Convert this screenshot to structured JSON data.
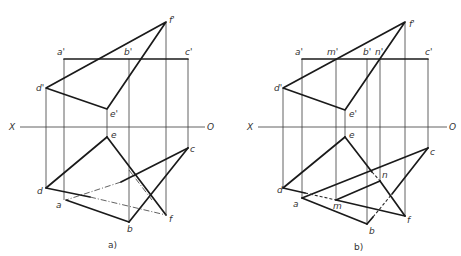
{
  "figure_a": {
    "caption": "a)",
    "axis": {
      "left_label": "X",
      "right_label": "O"
    },
    "labels": {
      "a_prime": "a'",
      "b_prime": "b'",
      "c_prime": "c'",
      "d_prime": "d'",
      "e_prime": "e'",
      "f_prime": "f'",
      "a": "a",
      "b": "b",
      "c": "c",
      "d": "d",
      "e": "e",
      "f": "f"
    }
  },
  "figure_b": {
    "caption": "b)",
    "axis": {
      "left_label": "X",
      "right_label": "O"
    },
    "labels": {
      "a_prime": "a'",
      "m_prime": "m'",
      "b_prime": "b'",
      "n_prime": "n'",
      "c_prime": "c'",
      "d_prime": "d'",
      "e_prime": "e'",
      "f_prime": "f'",
      "a": "a",
      "m": "m",
      "b": "b",
      "n": "n",
      "c": "c",
      "d": "d",
      "e": "e",
      "f": "f"
    }
  },
  "colors": {
    "line": "#1a1a1a",
    "projection": "#3a3a3a",
    "background": "#ffffff"
  }
}
